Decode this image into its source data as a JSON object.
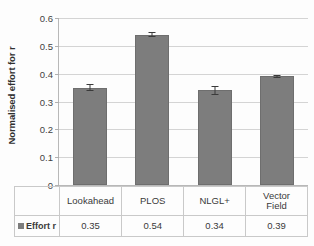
{
  "chart_data": {
    "type": "bar",
    "title": "",
    "xlabel": "",
    "ylabel": "Normalised effort for r",
    "categories": [
      "Lookahead",
      "PLOS",
      "NLGL+",
      "Vector Field"
    ],
    "series": [
      {
        "name": "Effort r",
        "values": [
          0.35,
          0.54,
          0.34,
          0.39
        ],
        "errors": [
          0.012,
          0.009,
          0.015,
          0.006
        ]
      }
    ],
    "ylim": [
      0,
      0.6
    ],
    "yticks": [
      0,
      0.1,
      0.2,
      0.3,
      0.4,
      0.5,
      0.6
    ],
    "ytick_labels": [
      "0",
      "0.1",
      "0.2",
      "0.3",
      "0.4",
      "0.5",
      "0.6"
    ],
    "grid": true,
    "legend_position": "table-row-left",
    "bar_color": "#7d7d7d",
    "gridline_color": "#d4d4d4",
    "axis_color": "#b8b8b8"
  },
  "table": {
    "legend_label": "Effort r",
    "legend_swatch_name": "series-color-swatch",
    "category_row": [
      "Lookahead",
      "PLOS",
      "NLGL+",
      "Vector Field"
    ],
    "category_row_lines": [
      [
        "Lookahead"
      ],
      [
        "PLOS"
      ],
      [
        "NLGL+"
      ],
      [
        "Vector",
        "Field"
      ]
    ],
    "value_row": [
      "0.35",
      "0.54",
      "0.34",
      "0.39"
    ]
  }
}
